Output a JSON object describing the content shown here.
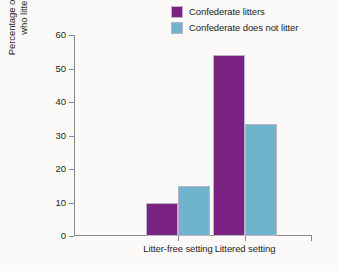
{
  "chart_data": {
    "type": "bar",
    "title": "",
    "xlabel": "",
    "ylabel": "Percentage of people who littered",
    "ylabel_lines": [
      "Percentage of people",
      "who littered"
    ],
    "categories": [
      "Litter-free setting",
      "Littered setting"
    ],
    "series": [
      {
        "name": "Confederate litters",
        "color": "#7B2382",
        "values": [
          10,
          54
        ]
      },
      {
        "name": "Confederate does not litter",
        "color": "#6FB4CC",
        "values": [
          15,
          33.3
        ]
      }
    ],
    "ylim": [
      0,
      60
    ],
    "yticks": [
      0,
      10,
      20,
      30,
      40,
      50,
      60
    ],
    "ytick_labels": [
      "0",
      "10",
      "20",
      "30",
      "40",
      "50",
      "60"
    ],
    "grid": false,
    "legend_position": "top-right"
  },
  "legend": {
    "items": [
      {
        "label": "Confederate litters",
        "color": "#7B2382"
      },
      {
        "label": "Confederate does not litter",
        "color": "#6FB4CC"
      }
    ]
  },
  "colors": {
    "purple": "#7B2382",
    "blue": "#6FB4CC",
    "axis": "#8a8a8a",
    "text": "#231f20",
    "background": "#fbfaf8"
  }
}
